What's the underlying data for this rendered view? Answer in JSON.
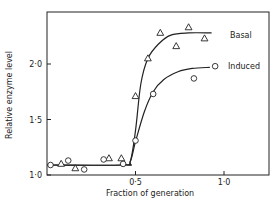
{
  "chart_data": {
    "type": "scatter",
    "title": "",
    "xlabel": "Fraction of generation",
    "ylabel": "Relative enzyme level",
    "xlim": [
      0,
      1.25
    ],
    "ylim": [
      1.0,
      2.45
    ],
    "grid": false,
    "legend_position": "right, inline near curve ends",
    "x_ticks": [
      {
        "value": 0.5,
        "label": "0·5"
      },
      {
        "value": 1.0,
        "label": "1·0"
      }
    ],
    "y_ticks": [
      {
        "value": 1.0,
        "label": "1·0"
      },
      {
        "value": 1.5,
        "label": "1·5"
      },
      {
        "value": 2.0,
        "label": "2·0"
      }
    ],
    "series": [
      {
        "name": "Basal",
        "marker": "triangle",
        "points": [
          {
            "x": 0.08,
            "y": 1.1
          },
          {
            "x": 0.16,
            "y": 1.06
          },
          {
            "x": 0.35,
            "y": 1.15
          },
          {
            "x": 0.42,
            "y": 1.15
          },
          {
            "x": 0.5,
            "y": 1.71
          },
          {
            "x": 0.57,
            "y": 2.05
          },
          {
            "x": 0.64,
            "y": 2.28
          },
          {
            "x": 0.73,
            "y": 2.16
          },
          {
            "x": 0.8,
            "y": 2.33
          },
          {
            "x": 0.89,
            "y": 2.23
          }
        ],
        "curve": [
          {
            "x": 0.0,
            "y": 1.09
          },
          {
            "x": 0.43,
            "y": 1.09
          },
          {
            "x": 0.47,
            "y": 1.12
          },
          {
            "x": 0.5,
            "y": 1.4
          },
          {
            "x": 0.53,
            "y": 1.82
          },
          {
            "x": 0.57,
            "y": 2.05
          },
          {
            "x": 0.63,
            "y": 2.18
          },
          {
            "x": 0.7,
            "y": 2.26
          },
          {
            "x": 0.8,
            "y": 2.28
          },
          {
            "x": 0.93,
            "y": 2.28
          }
        ]
      },
      {
        "name": "Induced",
        "marker": "circle",
        "points": [
          {
            "x": 0.02,
            "y": 1.09
          },
          {
            "x": 0.12,
            "y": 1.13
          },
          {
            "x": 0.21,
            "y": 1.05
          },
          {
            "x": 0.32,
            "y": 1.14
          },
          {
            "x": 0.43,
            "y": 1.1
          },
          {
            "x": 0.5,
            "y": 1.31
          },
          {
            "x": 0.6,
            "y": 1.73
          },
          {
            "x": 0.83,
            "y": 1.87
          },
          {
            "x": 0.95,
            "y": 1.98
          }
        ],
        "curve": [
          {
            "x": 0.0,
            "y": 1.09
          },
          {
            "x": 0.43,
            "y": 1.09
          },
          {
            "x": 0.47,
            "y": 1.12
          },
          {
            "x": 0.5,
            "y": 1.3
          },
          {
            "x": 0.55,
            "y": 1.57
          },
          {
            "x": 0.6,
            "y": 1.75
          },
          {
            "x": 0.66,
            "y": 1.86
          },
          {
            "x": 0.74,
            "y": 1.93
          },
          {
            "x": 0.82,
            "y": 1.96
          },
          {
            "x": 0.92,
            "y": 1.97
          }
        ]
      }
    ]
  }
}
